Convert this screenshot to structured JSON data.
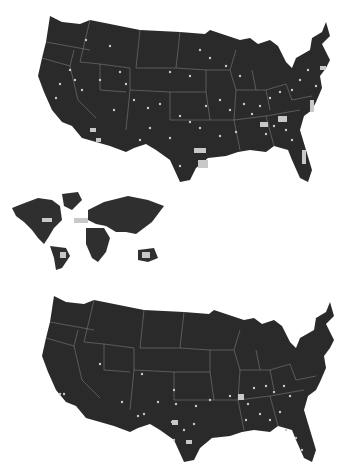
{
  "figure": {
    "panels": [
      {
        "id": "top",
        "type": "us-map",
        "description": "Contiguous United States with dense point markers",
        "land_color": "#2a2a2a",
        "border_color": "#8a8a8a",
        "marker_color": "#c8c8c8",
        "marker_density": "high"
      },
      {
        "id": "world",
        "type": "world-map",
        "description": "World map inset with scattered markers (N. America, N. Atlantic, S. America, Australia)",
        "land_color": "#2f2f2f",
        "marker_color": "#c8c8c8"
      },
      {
        "id": "bottom",
        "type": "us-map",
        "description": "Contiguous United States with sparse point markers",
        "land_color": "#2a2a2a",
        "border_color": "#8a8a8a",
        "marker_color": "#c8c8c8",
        "marker_density": "low"
      }
    ],
    "colors": {
      "background": "#ffffff",
      "land": "#2a2a2a",
      "borders": "#8a8a8a",
      "markers": "#c8c8c8"
    }
  }
}
